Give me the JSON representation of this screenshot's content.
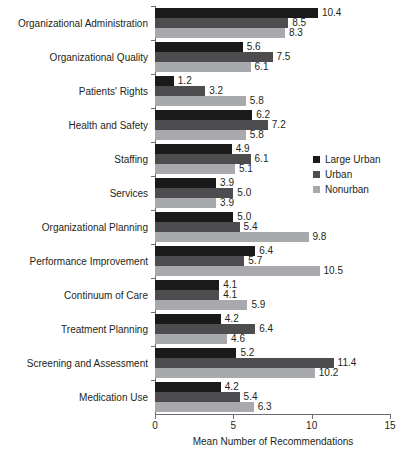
{
  "chart_data": {
    "type": "bar",
    "orientation": "horizontal",
    "title": "",
    "xlabel": "Mean Number of Recommendations",
    "ylabel": "",
    "xlim": [
      0,
      15
    ],
    "xticks": [
      0,
      5,
      10,
      15
    ],
    "xtick_labels": [
      "0",
      "5",
      "10",
      "15"
    ],
    "grid": false,
    "legend_position": "right-middle",
    "categories": [
      "Organizational Administration",
      "Organizational Quality",
      "Patients' Rights",
      "Health and Safety",
      "Staffing",
      "Services",
      "Organizational Planning",
      "Performance Improvement",
      "Continuum of Care",
      "Treatment Planning",
      "Screening and Assessment",
      "Medication Use"
    ],
    "series": [
      {
        "name": "Large Urban",
        "color": "#1a1a1a",
        "values": [
          10.4,
          5.6,
          1.2,
          6.2,
          4.9,
          3.9,
          5.0,
          6.4,
          4.1,
          4.2,
          5.2,
          4.2
        ],
        "labels": [
          "10.4",
          "5.6",
          "1.2",
          "6.2",
          "4.9",
          "3.9",
          "5.0",
          "6.4",
          "4.1",
          "4.2",
          "5.2",
          "4.2"
        ]
      },
      {
        "name": "Urban",
        "color": "#4d4d4f",
        "values": [
          8.5,
          7.5,
          3.2,
          7.2,
          6.1,
          5.0,
          5.4,
          5.7,
          4.1,
          6.4,
          11.4,
          5.4
        ],
        "labels": [
          "8.5",
          "7.5",
          "3.2",
          "7.2",
          "6.1",
          "5.0",
          "5.4",
          "5.7",
          "4.1",
          "6.4",
          "11.4",
          "5.4"
        ]
      },
      {
        "name": "Nonurban",
        "color": "#a7a9ac",
        "values": [
          8.3,
          6.1,
          5.8,
          5.8,
          5.1,
          3.9,
          9.8,
          10.5,
          5.9,
          4.6,
          10.2,
          6.3
        ],
        "labels": [
          "8.3",
          "6.1",
          "5.8",
          "5.8",
          "5.1",
          "3.9",
          "9.8",
          "10.5",
          "5.9",
          "4.6",
          "10.2",
          "6.3"
        ]
      }
    ]
  },
  "legend": {
    "items": [
      {
        "label": "Large Urban",
        "color": "#1a1a1a"
      },
      {
        "label": "Urban",
        "color": "#4d4d4f"
      },
      {
        "label": "Nonurban",
        "color": "#a7a9ac"
      }
    ]
  },
  "axis": {
    "x_title": "Mean Number of Recommendations"
  }
}
